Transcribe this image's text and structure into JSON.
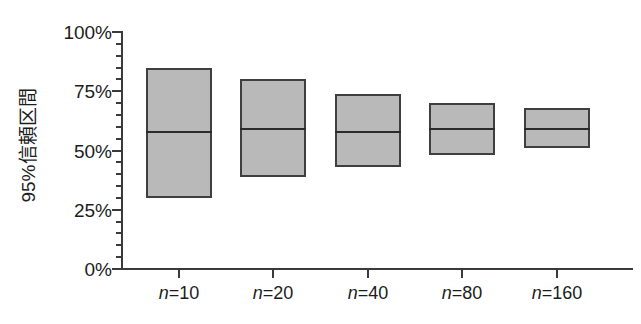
{
  "chart_data": {
    "type": "bar",
    "title": "",
    "subtitle": "",
    "xlabel": "",
    "ylabel": "95%信頼区間",
    "categories": [
      "n=10",
      "n=20",
      "n=40",
      "n=80",
      "n=160"
    ],
    "category_prefix": "n",
    "category_sample_sizes": [
      10,
      20,
      40,
      80,
      160
    ],
    "ylim": [
      0,
      100
    ],
    "y_unit": "%",
    "y_tick_labels": [
      "0%",
      "25%",
      "50%",
      "75%",
      "100%"
    ],
    "y_tick_values": [
      0,
      25,
      50,
      75,
      100
    ],
    "y_minor_tick_step": 5,
    "grid": false,
    "legend": null,
    "series": [
      {
        "name": "95%信頼区間 下限",
        "values": [
          30,
          39,
          43,
          48,
          51
        ]
      },
      {
        "name": "95%信頼区間 上限",
        "values": [
          85,
          80,
          74,
          70,
          68
        ]
      },
      {
        "name": "点推定値",
        "values": [
          58,
          59,
          58,
          59,
          59
        ]
      }
    ],
    "intervals": [
      {
        "label": "n=10",
        "lower": 30,
        "upper": 85,
        "estimate": 58
      },
      {
        "label": "n=20",
        "lower": 39,
        "upper": 80,
        "estimate": 59
      },
      {
        "label": "n=40",
        "lower": 43,
        "upper": 74,
        "estimate": 58
      },
      {
        "label": "n=80",
        "lower": 48,
        "upper": 70,
        "estimate": 59
      },
      {
        "label": "n=160",
        "lower": 51,
        "upper": 68,
        "estimate": 59
      }
    ],
    "colors": {
      "box_fill": "#b9b9b9",
      "box_border": "#3f3f3f",
      "median_line": "#2b2b2b",
      "axis": "#3a3a3a",
      "text": "#1c1c1c",
      "background": "#ffffff"
    }
  }
}
